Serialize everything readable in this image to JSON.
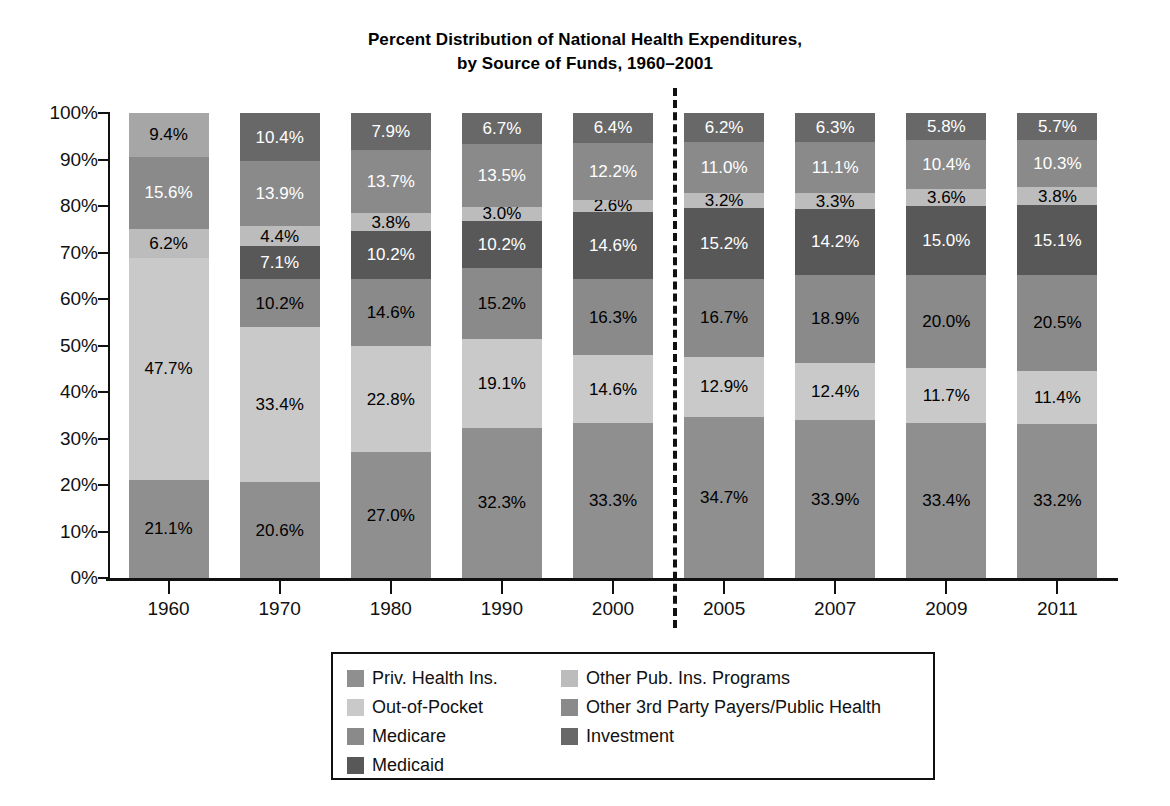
{
  "title": {
    "line1": "Percent Distribution of National Health Expenditures,",
    "line2": "by Source of Funds, 1960–2001"
  },
  "axes": {
    "y_ticks": [
      "100%",
      "90%",
      "80%",
      "70%",
      "60%",
      "50%",
      "40%",
      "30%",
      "20%",
      "10%",
      "0%"
    ],
    "x_ticks": [
      "1960",
      "1970",
      "1980",
      "1990",
      "2000",
      "2005",
      "2007",
      "2009",
      "2011"
    ]
  },
  "legend": {
    "left_column": [
      {
        "label": "Priv. Health Ins.",
        "color": "#8f8f8f",
        "key": "priv_health_ins"
      },
      {
        "label": "Out-of-Pocket",
        "color": "#c9c9c9",
        "key": "out_of_pocket"
      },
      {
        "label": "Medicare",
        "color": "#8a8a8a",
        "key": "medicare"
      },
      {
        "label": "Medicaid",
        "color": "#585858",
        "key": "medicaid"
      }
    ],
    "right_column": [
      {
        "label": "Other Pub. Ins. Programs",
        "color": "#bcbcbc",
        "key": "other_pub_ins"
      },
      {
        "label": "Other 3rd Party Payers/Public Health",
        "color": "#8a8a8a",
        "key": "other_3rd_party"
      },
      {
        "label": "Investment",
        "color": "#686868",
        "key": "investment"
      }
    ]
  },
  "chart_data": {
    "type": "bar",
    "subtype": "stacked-100-percent",
    "title": "Percent Distribution of National Health Expenditures, by Source of Funds, 1960–2001",
    "xlabel": "",
    "ylabel": "",
    "ylim": [
      0,
      100
    ],
    "ytick_step": 10,
    "grid": false,
    "legend_position": "bottom",
    "categories": [
      "1960",
      "1970",
      "1980",
      "1990",
      "2000",
      "2005",
      "2007",
      "2009",
      "2011"
    ],
    "series": [
      {
        "name": "Priv. Health Ins.",
        "color": "#8f8f8f",
        "values": [
          21.1,
          20.6,
          27.0,
          32.3,
          33.3,
          34.7,
          33.9,
          33.4,
          33.2
        ],
        "labels": [
          "21.1%",
          "20.6%",
          "27.0%",
          "32.3%",
          "33.3%",
          "34.7%",
          "33.9%",
          "33.4%",
          "33.2%"
        ],
        "label_color": "#000000"
      },
      {
        "name": "Out-of-Pocket",
        "color": "#c9c9c9",
        "values": [
          47.7,
          33.4,
          22.8,
          19.1,
          14.6,
          12.9,
          12.4,
          11.7,
          11.4
        ],
        "labels": [
          "47.7%",
          "33.4%",
          "22.8%",
          "19.1%",
          "14.6%",
          "12.9%",
          "12.4%",
          "11.7%",
          "11.4%"
        ],
        "label_color": "#000000"
      },
      {
        "name": "Medicare",
        "color": "#8a8a8a",
        "values": [
          0,
          10.2,
          14.6,
          15.2,
          16.3,
          16.7,
          18.9,
          20.0,
          20.5
        ],
        "labels": [
          "",
          "10.2%",
          "14.6%",
          "15.2%",
          "16.3%",
          "16.7%",
          "18.9%",
          "20.0%",
          "20.5%"
        ],
        "label_color": "#000000"
      },
      {
        "name": "Medicaid",
        "color": "#585858",
        "values": [
          0,
          7.1,
          10.2,
          10.2,
          14.6,
          15.2,
          14.2,
          15.0,
          15.1
        ],
        "labels": [
          "",
          "7.1%",
          "10.2%",
          "10.2%",
          "14.6%",
          "15.2%",
          "14.2%",
          "15.0%",
          "15.1%"
        ],
        "label_color": "#ffffff"
      },
      {
        "name": "Other Pub. Ins. Programs",
        "color": "#bcbcbc",
        "values": [
          6.2,
          4.4,
          3.8,
          3.0,
          2.6,
          3.2,
          3.3,
          3.6,
          3.8
        ],
        "labels": [
          "6.2%",
          "4.4%",
          "3.8%",
          "3.0%",
          "2.6%",
          "3.2%",
          "3.3%",
          "3.6%",
          "3.8%"
        ],
        "label_color": "#000000"
      },
      {
        "name": "Other 3rd Party Payers/Public Health",
        "color": "#8a8a8a",
        "values": [
          15.6,
          13.9,
          13.7,
          13.5,
          12.2,
          11.0,
          11.1,
          10.4,
          10.3
        ],
        "labels": [
          "15.6%",
          "13.9%",
          "13.7%",
          "13.5%",
          "12.2%",
          "11.0%",
          "11.1%",
          "10.4%",
          "10.3%"
        ],
        "label_color": "#ffffff"
      },
      {
        "name": "Investment",
        "color": "#686868",
        "values": [
          9.4,
          10.4,
          7.9,
          6.7,
          6.4,
          6.2,
          6.3,
          5.8,
          5.7
        ],
        "labels": [
          "9.4%",
          "10.4%",
          "7.9%",
          "6.7%",
          "6.4%",
          "6.2%",
          "6.3%",
          "5.8%",
          "5.7%"
        ],
        "label_color": "#ffffff",
        "overrides": [
          {
            "index": 0,
            "color": "#a6a6a6",
            "label_color": "#000000"
          }
        ]
      }
    ],
    "annotations": [
      {
        "type": "vertical-dashed-line",
        "name": "period-divider",
        "between": [
          "2000",
          "2005"
        ]
      }
    ]
  }
}
